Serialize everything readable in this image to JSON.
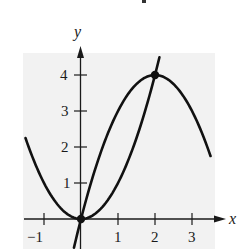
{
  "chart_data": {
    "type": "line",
    "title": "",
    "xlabel": "x",
    "ylabel": "y",
    "xlim": [
      -1.5,
      3.5
    ],
    "ylim": [
      -0.8,
      4.6
    ],
    "x_ticks": [
      -1,
      1,
      2,
      3
    ],
    "x_tick_labels": [
      "−1",
      "1",
      "2",
      "3"
    ],
    "y_ticks": [
      1,
      2,
      3,
      4
    ],
    "y_tick_labels": [
      "1",
      "2",
      "3",
      "4"
    ],
    "grid": false,
    "legend": null,
    "series": [
      {
        "name": "y = x^2",
        "x": [
          -1.5,
          -1,
          -0.5,
          0,
          0.5,
          1,
          1.5,
          2,
          2.12
        ],
        "y": [
          2.25,
          1,
          0.25,
          0,
          0.25,
          1,
          2.25,
          4,
          4.5
        ]
      },
      {
        "name": "y = 4x - x^2",
        "x": [
          -0.19,
          0,
          0.5,
          1,
          1.5,
          2,
          2.5,
          3,
          3.5
        ],
        "y": [
          -0.8,
          0,
          1.75,
          3,
          3.75,
          4,
          3.75,
          3,
          1.75
        ]
      }
    ],
    "points": [
      {
        "x": 0,
        "y": 0,
        "label": "intersection"
      },
      {
        "x": 2,
        "y": 4,
        "label": "intersection"
      }
    ],
    "background_color": "#f2f2f2",
    "line_color": "#111111"
  },
  "labels": {
    "x_axis": "x",
    "y_axis": "y",
    "x_tick_neg1": "−1",
    "x_tick_1": "1",
    "x_tick_2": "2",
    "x_tick_3": "3",
    "y_tick_1": "1",
    "y_tick_2": "2",
    "y_tick_3": "3",
    "y_tick_4": "4"
  }
}
